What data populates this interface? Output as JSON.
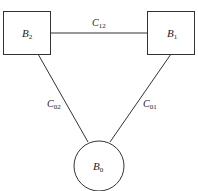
{
  "diagram": {
    "nodes": [
      {
        "id": "B2",
        "shape": "rectangle",
        "label": "B",
        "subscript": "2"
      },
      {
        "id": "B1",
        "shape": "rectangle",
        "label": "B",
        "subscript": "1"
      },
      {
        "id": "B0",
        "shape": "circle",
        "label": "B",
        "subscript": "0"
      }
    ],
    "edges": [
      {
        "from": "B2",
        "to": "B1",
        "label": "C",
        "subscript": "12"
      },
      {
        "from": "B2",
        "to": "B0",
        "label": "C",
        "subscript": "02"
      },
      {
        "from": "B1",
        "to": "B0",
        "label": "C",
        "subscript": "01"
      }
    ],
    "colors": {
      "stroke": "#333333",
      "background": "#ffffff"
    }
  }
}
